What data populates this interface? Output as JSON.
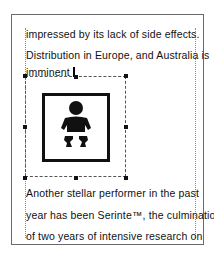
{
  "document": {
    "lines_before": [
      "impressed by its lack of side effects.",
      "Distribution in Europe, and Australia is",
      "imminent"
    ],
    "lines_after": [
      "Another stellar performer in the past",
      "year has been Serinte™, the culmination",
      "of two years of intensive research on"
    ]
  },
  "picture": {
    "icon": "baby-changing-icon",
    "selected": true
  },
  "colors": {
    "page_border": "#6a6a6a",
    "text": "#111111",
    "selection": "#555555"
  }
}
